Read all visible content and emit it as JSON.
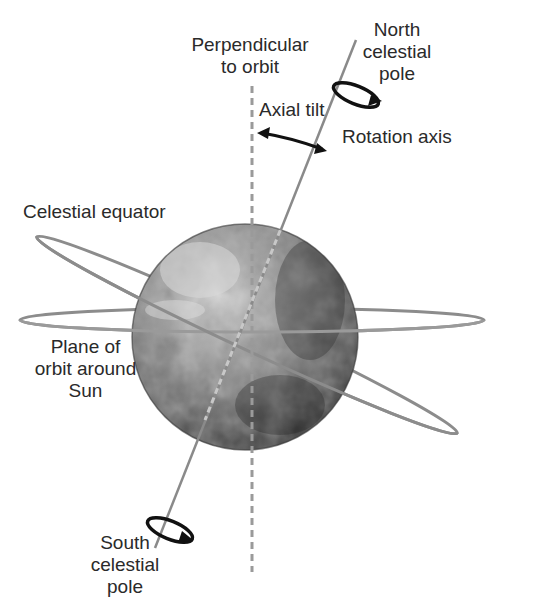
{
  "diagram": {
    "colors": {
      "background": "#ffffff",
      "text": "#2a2a2a",
      "ring": "#8c8c8c",
      "axis": "#8a8a8a",
      "dashed": "#9a9a9a",
      "arrow": "#111111",
      "globe_light": "#bdbdbd",
      "globe_dark": "#2e2e2e"
    },
    "labels": {
      "perpendicular": "Perpendicular\nto orbit",
      "perpendicular_line1": "Perpendicular",
      "perpendicular_line2": "to orbit",
      "north_line1": "North",
      "north_line2": "celestial",
      "north_line3": "pole",
      "axial_tilt": "Axial tilt",
      "rotation_axis": "Rotation axis",
      "celestial_equator": "Celestial equator",
      "plane_line1": "Plane of",
      "plane_line2": "orbit around",
      "plane_line3": "Sun",
      "south_line1": "South",
      "south_line2": "celestial",
      "south_line3": "pole"
    }
  }
}
